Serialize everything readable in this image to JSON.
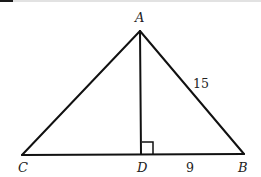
{
  "diagram": {
    "type": "geometry-triangle",
    "points": {
      "A": {
        "label": "A",
        "x": 140,
        "y": 31
      },
      "B": {
        "label": "B",
        "x": 244,
        "y": 154
      },
      "C": {
        "label": "C",
        "x": 22,
        "y": 155
      },
      "D": {
        "label": "D",
        "x": 141,
        "y": 154
      }
    },
    "segments": [
      {
        "from": "A",
        "to": "B",
        "label": "15"
      },
      {
        "from": "A",
        "to": "C",
        "label": ""
      },
      {
        "from": "C",
        "to": "B",
        "label": ""
      },
      {
        "from": "A",
        "to": "D",
        "label": ""
      },
      {
        "from": "D",
        "to": "B",
        "label": "9"
      }
    ],
    "labels": {
      "A": "A",
      "B": "B",
      "C": "C",
      "D": "D",
      "AB": "15",
      "DB": "9"
    },
    "right_angle_at": "D",
    "stroke_color": "#111111",
    "text_color": "#222222"
  }
}
